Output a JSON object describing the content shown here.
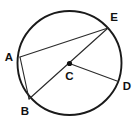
{
  "figure": {
    "kind": "circle-geometry-diagram",
    "canvas": {
      "width": 136,
      "height": 123,
      "background": "#ffffff"
    },
    "colors": {
      "circle_stroke": "#1a1a1a",
      "chord_stroke": "#2b2b2b",
      "label_color": "#111111",
      "center_dot": "#111111"
    },
    "circle": {
      "center_label": "C",
      "cx": 69.5,
      "cy": 63,
      "r": 52,
      "stroke_width": 1.9
    },
    "center_dot": {
      "label": "C",
      "x": 69.5,
      "y": 63.5,
      "r": 2.6
    },
    "points": [
      {
        "label": "A",
        "x": 20.0,
        "y": 57.0,
        "label_x": 9.0,
        "label_y": 61.0,
        "anchor": "middle"
      },
      {
        "label": "B",
        "x": 29.0,
        "y": 99.0,
        "label_x": 25.0,
        "label_y": 115.0,
        "anchor": "middle"
      },
      {
        "label": "C",
        "x": 69.5,
        "y": 63.5,
        "label_x": 69.5,
        "label_y": 80.0,
        "anchor": "middle"
      },
      {
        "label": "D",
        "x": 117.0,
        "y": 81.0,
        "label_x": 127.0,
        "label_y": 90.0,
        "anchor": "middle"
      },
      {
        "label": "E",
        "x": 108.0,
        "y": 28.0,
        "label_x": 114.0,
        "label_y": 21.0,
        "anchor": "middle"
      }
    ],
    "segments": [
      {
        "name": "chord-AE",
        "from": "A",
        "to": "E",
        "x1": 20.0,
        "y1": 57.0,
        "x2": 108.0,
        "y2": 28.0
      },
      {
        "name": "chord-AB",
        "from": "A",
        "to": "B",
        "x1": 20.0,
        "y1": 57.0,
        "x2": 29.0,
        "y2": 99.0
      },
      {
        "name": "diameter-BE",
        "from": "B",
        "to": "E",
        "x1": 29.0,
        "y1": 99.0,
        "x2": 108.0,
        "y2": 28.0
      },
      {
        "name": "radius-CD",
        "from": "C",
        "to": "D",
        "x1": 69.5,
        "y1": 63.5,
        "x2": 117.0,
        "y2": 81.0
      }
    ],
    "labels": {
      "a": "A",
      "b": "B",
      "c": "C",
      "d": "D",
      "e": "E"
    }
  }
}
